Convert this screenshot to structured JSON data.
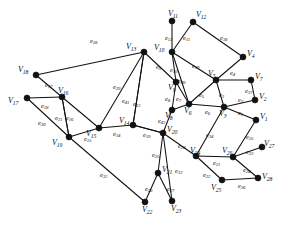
{
  "figure": {
    "background_color": "#ffffff",
    "stroke_color": "#111111",
    "vertex_color": "#111111",
    "width": 288,
    "height": 226
  },
  "chart_data": {
    "type": "diagram",
    "subtype": "node-link-graph",
    "title": "",
    "vertex_count": 28,
    "edge_count": 42,
    "vertices": [
      {
        "id": "V1",
        "label": "V",
        "sub": "1",
        "x": 256,
        "y": 120,
        "label_x": 260,
        "label_y": 113
      },
      {
        "id": "V2",
        "label": "V",
        "sub": "2",
        "x": 255,
        "y": 100,
        "label_x": 259,
        "label_y": 93
      },
      {
        "id": "V3",
        "label": "V",
        "sub": "3",
        "x": 224,
        "y": 107,
        "label_x": 219,
        "label_y": 110
      },
      {
        "id": "V4",
        "label": "V",
        "sub": "4",
        "x": 243,
        "y": 57,
        "label_x": 247,
        "label_y": 50
      },
      {
        "id": "V5",
        "label": "V",
        "sub": "5",
        "x": 216,
        "y": 80,
        "label_x": 208,
        "label_y": 70
      },
      {
        "id": "V6",
        "label": "V",
        "sub": "6",
        "x": 189,
        "y": 104,
        "label_x": 184,
        "label_y": 107
      },
      {
        "id": "V7",
        "label": "V",
        "sub": "7",
        "x": 251,
        "y": 80,
        "label_x": 255,
        "label_y": 73
      },
      {
        "id": "V8",
        "label": "V",
        "sub": "8",
        "x": 172,
        "y": 110,
        "label_x": 165,
        "label_y": 112
      },
      {
        "id": "V9",
        "label": "V",
        "sub": "9",
        "x": 176,
        "y": 82,
        "label_x": 168,
        "label_y": 84
      },
      {
        "id": "V10",
        "label": "V",
        "sub": "10",
        "x": 172,
        "y": 52,
        "label_x": 154,
        "label_y": 44
      },
      {
        "id": "V11",
        "label": "V",
        "sub": "11",
        "x": 172,
        "y": 21,
        "label_x": 168,
        "label_y": 10
      },
      {
        "id": "V12",
        "label": "V",
        "sub": "12",
        "x": 193,
        "y": 22,
        "label_x": 196,
        "label_y": 11
      },
      {
        "id": "V13",
        "label": "V",
        "sub": "13",
        "x": 144,
        "y": 52,
        "label_x": 126,
        "label_y": 43
      },
      {
        "id": "V14",
        "label": "V",
        "sub": "14",
        "x": 133,
        "y": 125,
        "label_x": 119,
        "label_y": 117
      },
      {
        "id": "V15",
        "label": "V",
        "sub": "15",
        "x": 99,
        "y": 128,
        "label_x": 86,
        "label_y": 130
      },
      {
        "id": "V16",
        "label": "V",
        "sub": "16",
        "x": 62,
        "y": 97,
        "label_x": 58,
        "label_y": 87
      },
      {
        "id": "V17",
        "label": "V",
        "sub": "17",
        "x": 27,
        "y": 98,
        "label_x": 8,
        "label_y": 97
      },
      {
        "id": "V18",
        "label": "V",
        "sub": "18",
        "x": 36,
        "y": 75,
        "label_x": 18,
        "label_y": 66
      },
      {
        "id": "V19",
        "label": "V",
        "sub": "19",
        "x": 69,
        "y": 137,
        "label_x": 52,
        "label_y": 139
      },
      {
        "id": "V20",
        "label": "V",
        "sub": "20",
        "x": 163,
        "y": 133,
        "label_x": 167,
        "label_y": 126
      },
      {
        "id": "V21",
        "label": "V",
        "sub": "21",
        "x": 158,
        "y": 173,
        "label_x": 162,
        "label_y": 166
      },
      {
        "id": "V22",
        "label": "V",
        "sub": "22",
        "x": 145,
        "y": 202,
        "label_x": 142,
        "label_y": 206
      },
      {
        "id": "V23",
        "label": "V",
        "sub": "23",
        "x": 172,
        "y": 201,
        "label_x": 171,
        "label_y": 205
      },
      {
        "id": "V24",
        "label": "V",
        "sub": "24",
        "x": 196,
        "y": 156,
        "label_x": 190,
        "label_y": 147
      },
      {
        "id": "V25",
        "label": "V",
        "sub": "25",
        "x": 222,
        "y": 180,
        "label_x": 211,
        "label_y": 184
      },
      {
        "id": "V26",
        "label": "V",
        "sub": "26",
        "x": 233,
        "y": 157,
        "label_x": 222,
        "label_y": 147
      },
      {
        "id": "V27",
        "label": "V",
        "sub": "27",
        "x": 262,
        "y": 147,
        "label_x": 264,
        "label_y": 140
      },
      {
        "id": "V28",
        "label": "V",
        "sub": "28",
        "x": 258,
        "y": 178,
        "label_x": 262,
        "label_y": 173
      }
    ],
    "edges": [
      {
        "id": "e1",
        "label": "e",
        "sub": "1",
        "source": "V3",
        "target": "V1",
        "label_x": 238,
        "label_y": 110
      },
      {
        "id": "e2",
        "label": "e",
        "sub": "2",
        "source": "V3",
        "target": "V2",
        "label_x": 238,
        "label_y": 97
      },
      {
        "id": "e3",
        "label": "e",
        "sub": "3",
        "source": "V5",
        "target": "V3",
        "label_x": 219,
        "label_y": 92
      },
      {
        "id": "e4",
        "label": "e",
        "sub": "4",
        "source": "V5",
        "target": "V4",
        "label_x": 230,
        "label_y": 70
      },
      {
        "id": "e5",
        "label": "e",
        "sub": "5",
        "source": "V5",
        "target": "V6",
        "label_x": 199,
        "label_y": 92
      },
      {
        "id": "e6",
        "label": "e",
        "sub": "6",
        "source": "V6",
        "target": "V3",
        "label_x": 205,
        "label_y": 109
      },
      {
        "id": "e7",
        "label": "e",
        "sub": "7",
        "source": "V9",
        "target": "V6",
        "label_x": 176,
        "label_y": 96
      },
      {
        "id": "e8",
        "label": "e",
        "sub": "8",
        "source": "V9",
        "target": "V8",
        "label_x": 165,
        "label_y": 96
      },
      {
        "id": "e9",
        "label": "e",
        "sub": "9",
        "source": "V13",
        "target": "V9",
        "label_x": 156,
        "label_y": 64
      },
      {
        "id": "e10",
        "label": "e",
        "sub": "10",
        "source": "V10",
        "target": "V9",
        "label_x": 170,
        "label_y": 67
      },
      {
        "id": "e11",
        "label": "e",
        "sub": "11",
        "source": "V10",
        "target": "V12",
        "label_x": 183,
        "label_y": 35
      },
      {
        "id": "e12",
        "label": "e",
        "sub": "12",
        "source": "V10",
        "target": "V11",
        "label_x": 165,
        "label_y": 35
      },
      {
        "id": "e13",
        "label": "e",
        "sub": "13",
        "source": "V13",
        "target": "V14",
        "label_x": 133,
        "label_y": 101
      },
      {
        "id": "e14",
        "label": "e",
        "sub": "14",
        "source": "V15",
        "target": "V14",
        "label_x": 113,
        "label_y": 131
      },
      {
        "id": "e15",
        "label": "e",
        "sub": "15",
        "source": "V19",
        "target": "V15",
        "label_x": 84,
        "label_y": 136
      },
      {
        "id": "e16",
        "label": "e",
        "sub": "16",
        "source": "V16",
        "target": "V19",
        "label_x": 66,
        "label_y": 115
      },
      {
        "id": "e17",
        "label": "e",
        "sub": "17",
        "source": "V18",
        "target": "V16",
        "label_x": 45,
        "label_y": 82
      },
      {
        "id": "e18",
        "label": "e",
        "sub": "18",
        "source": "V17",
        "target": "V16",
        "label_x": 41,
        "label_y": 103
      },
      {
        "id": "e19",
        "label": "e",
        "sub": "19",
        "source": "V14",
        "target": "V20",
        "label_x": 143,
        "label_y": 132
      },
      {
        "id": "e20",
        "label": "e",
        "sub": "20",
        "source": "V20",
        "target": "V24",
        "label_x": 178,
        "label_y": 143
      },
      {
        "id": "e21",
        "label": "e",
        "sub": "21",
        "source": "V24",
        "target": "V26",
        "label_x": 213,
        "label_y": 160
      },
      {
        "id": "e22",
        "label": "e",
        "sub": "22",
        "source": "V24",
        "target": "V25",
        "label_x": 203,
        "label_y": 172
      },
      {
        "id": "e23",
        "label": "e",
        "sub": "23",
        "source": "V26",
        "target": "V27",
        "label_x": 246,
        "label_y": 149
      },
      {
        "id": "e24",
        "label": "e",
        "sub": "24",
        "source": "V26",
        "target": "V28",
        "label_x": 243,
        "label_y": 167
      },
      {
        "id": "e25",
        "label": "e",
        "sub": "25",
        "source": "V20",
        "target": "V21",
        "label_x": 152,
        "label_y": 152
      },
      {
        "id": "e26",
        "label": "e",
        "sub": "26",
        "source": "V21",
        "target": "V22",
        "label_x": 145,
        "label_y": 186
      },
      {
        "id": "e27",
        "label": "e",
        "sub": "27",
        "source": "V21",
        "target": "V23",
        "label_x": 167,
        "label_y": 186
      },
      {
        "id": "e28",
        "label": "e",
        "sub": "28",
        "source": "V18",
        "target": "V13",
        "label_x": 90,
        "label_y": 38
      },
      {
        "id": "e29",
        "label": "e",
        "sub": "29",
        "source": "V13",
        "target": "V15",
        "label_x": 113,
        "label_y": 84
      },
      {
        "id": "e30",
        "label": "e",
        "sub": "30",
        "source": "V17",
        "target": "V19",
        "label_x": 38,
        "label_y": 120
      },
      {
        "id": "e31",
        "label": "e",
        "sub": "31",
        "source": "V16",
        "target": "V19",
        "label_x": 55,
        "label_y": 115
      },
      {
        "id": "e32",
        "label": "e",
        "sub": "32",
        "source": "V19",
        "target": "V22",
        "label_x": 100,
        "label_y": 172
      },
      {
        "id": "e33",
        "label": "e",
        "sub": "33",
        "source": "V20",
        "target": "V23",
        "label_x": 175,
        "label_y": 168
      },
      {
        "id": "e34",
        "label": "e",
        "sub": "34",
        "source": "V3",
        "target": "V24",
        "label_x": 206,
        "label_y": 132
      },
      {
        "id": "e35",
        "label": "e",
        "sub": "35",
        "source": "V1",
        "target": "V26",
        "label_x": 246,
        "label_y": 134
      },
      {
        "id": "e36",
        "label": "e",
        "sub": "36",
        "source": "V25",
        "target": "V28",
        "label_x": 238,
        "label_y": 183
      },
      {
        "id": "e37",
        "label": "e",
        "sub": "37",
        "source": "V7",
        "target": "V2",
        "label_x": 245,
        "label_y": 88
      },
      {
        "id": "e38",
        "label": "e",
        "sub": "38",
        "source": "V12",
        "target": "V4",
        "label_x": 220,
        "label_y": 35
      },
      {
        "id": "e39",
        "label": "e",
        "sub": "39",
        "source": "V10",
        "target": "V5",
        "label_x": 192,
        "label_y": 63
      },
      {
        "id": "e40",
        "label": "e",
        "sub": "40",
        "source": "V10",
        "target": "V6",
        "label_x": 178,
        "label_y": 78
      },
      {
        "id": "e41",
        "label": "e",
        "sub": "41",
        "source": "V13",
        "target": "V14",
        "label_x": 122,
        "label_y": 98
      },
      {
        "id": "e42",
        "label": "e",
        "sub": "42",
        "source": "V8",
        "target": "V20",
        "label_x": 158,
        "label_y": 118
      }
    ],
    "extra_edges": [
      {
        "source": "V5",
        "target": "V7"
      },
      {
        "source": "V16",
        "target": "V15"
      },
      {
        "source": "V14",
        "target": "V20"
      },
      {
        "source": "V8",
        "target": "V6"
      }
    ]
  }
}
